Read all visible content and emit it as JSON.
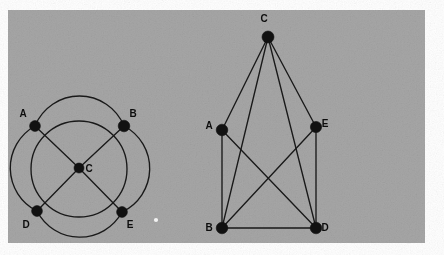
{
  "figure": {
    "background_color": "#ffffff",
    "panel_color": "#a6a6a6",
    "ink_color": "#191919",
    "node_color": "#111111",
    "panel": {
      "x": 8,
      "y": 10,
      "width": 417,
      "height": 233
    },
    "artifact_speck": {
      "x": 156,
      "y": 220,
      "r": 2.1,
      "color": "#f2f2f2"
    }
  },
  "graphs": [
    {
      "id": "graph-left",
      "layout": "circular",
      "circle": {
        "cx": 79,
        "cy": 169,
        "r": 48
      },
      "nodes": [
        {
          "id": "A",
          "label": "A",
          "x": 35,
          "y": 126,
          "r": 5.4,
          "label_x": 23,
          "label_y": 117
        },
        {
          "id": "B",
          "label": "B",
          "x": 124,
          "y": 126,
          "r": 5.8,
          "label_x": 133,
          "label_y": 117
        },
        {
          "id": "C",
          "label": "C",
          "x": 79,
          "y": 168,
          "r": 5.0,
          "label_x": 89,
          "label_y": 172
        },
        {
          "id": "D",
          "label": "D",
          "x": 37,
          "y": 211,
          "r": 5.4,
          "label_x": 26,
          "label_y": 228
        },
        {
          "id": "E",
          "label": "E",
          "x": 122,
          "y": 212,
          "r": 5.4,
          "label_x": 130,
          "label_y": 228
        }
      ],
      "straight_edges": [
        {
          "from": "A",
          "to": "C"
        },
        {
          "from": "C",
          "to": "E"
        },
        {
          "from": "B",
          "to": "C"
        },
        {
          "from": "C",
          "to": "D"
        }
      ],
      "arc_edges": [
        {
          "from": "A",
          "to": "B",
          "arc": "top"
        },
        {
          "from": "B",
          "to": "E",
          "arc": "right"
        },
        {
          "from": "E",
          "to": "D",
          "arc": "bottom"
        },
        {
          "from": "D",
          "to": "A",
          "arc": "left"
        }
      ]
    },
    {
      "id": "graph-right",
      "layout": "planar",
      "nodes": [
        {
          "id": "C",
          "label": "C",
          "x": 268,
          "y": 37,
          "r": 6.0,
          "label_x": 264,
          "label_y": 22
        },
        {
          "id": "A",
          "label": "A",
          "x": 222,
          "y": 130,
          "r": 5.8,
          "label_x": 209,
          "label_y": 129
        },
        {
          "id": "E",
          "label": "E",
          "x": 316,
          "y": 127,
          "r": 5.6,
          "label_x": 325,
          "label_y": 127
        },
        {
          "id": "B",
          "label": "B",
          "x": 222,
          "y": 228,
          "r": 5.8,
          "label_x": 209,
          "label_y": 231
        },
        {
          "id": "D",
          "label": "D",
          "x": 316,
          "y": 228,
          "r": 5.8,
          "label_x": 325,
          "label_y": 231
        }
      ],
      "straight_edges": [
        {
          "from": "C",
          "to": "A"
        },
        {
          "from": "C",
          "to": "B"
        },
        {
          "from": "C",
          "to": "D"
        },
        {
          "from": "C",
          "to": "E"
        },
        {
          "from": "A",
          "to": "B"
        },
        {
          "from": "A",
          "to": "D"
        },
        {
          "from": "E",
          "to": "B"
        },
        {
          "from": "E",
          "to": "D"
        },
        {
          "from": "B",
          "to": "D"
        }
      ],
      "arc_edges": []
    }
  ]
}
